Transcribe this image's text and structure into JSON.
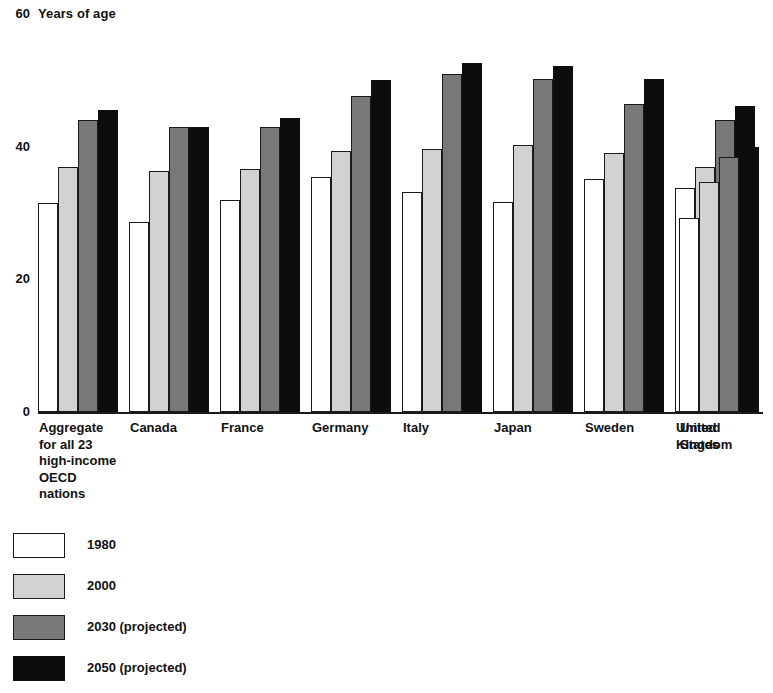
{
  "chart_data": {
    "type": "bar",
    "title": "Years of age",
    "xlabel": "",
    "ylabel": "Years of age",
    "ylim": [
      0,
      60
    ],
    "yticks": [
      0,
      20,
      40,
      60
    ],
    "ytick_labels": [
      "0",
      "20",
      "40",
      "60"
    ],
    "grid": false,
    "legend_position": "bottom-left",
    "categories": [
      "Aggregate for all 23 high-income OECD nations",
      "Canada",
      "France",
      "Germany",
      "Italy",
      "Japan",
      "Sweden",
      "United Kingdom",
      "United States"
    ],
    "category_label_lines": [
      [
        "Aggregate",
        "for all 23",
        "high-income",
        "OECD",
        "nations"
      ],
      [
        "Canada"
      ],
      [
        "France"
      ],
      [
        "Germany"
      ],
      [
        "Italy"
      ],
      [
        "Japan"
      ],
      [
        "Sweden"
      ],
      [
        "United",
        "Kingdom"
      ],
      [
        "United",
        "States"
      ]
    ],
    "series": [
      {
        "name": "1980",
        "color": "#ffffff",
        "values": [
          31.5,
          28.7,
          32.0,
          35.5,
          33.2,
          31.7,
          35.1,
          33.8,
          29.3
        ]
      },
      {
        "name": "2000",
        "color": "#d2d2d2",
        "values": [
          37.0,
          36.3,
          36.7,
          39.3,
          39.6,
          40.3,
          39.1,
          36.9,
          34.7
        ]
      },
      {
        "name": "2030 (projected)",
        "color": "#787878",
        "values": [
          44.0,
          43.0,
          43.0,
          47.7,
          51.0,
          50.2,
          46.5,
          44.0,
          38.4
        ]
      },
      {
        "name": "2050 (projected)",
        "color": "#0d0d0d",
        "values": [
          45.5,
          43.0,
          44.3,
          50.0,
          52.6,
          52.1,
          50.2,
          46.2,
          40.0
        ]
      }
    ]
  },
  "legend": {
    "items": [
      {
        "label": "1980",
        "swatch": "white-swatch"
      },
      {
        "label": "2000",
        "swatch": "light-gray-swatch"
      },
      {
        "label": "2030 (projected)",
        "swatch": "dark-gray-swatch"
      },
      {
        "label": "2050 (projected)",
        "swatch": "black-swatch"
      }
    ]
  },
  "axis": {
    "unit_label": "Years of age",
    "top_tick": "60",
    "ticks": [
      "40",
      "20",
      "0"
    ]
  }
}
